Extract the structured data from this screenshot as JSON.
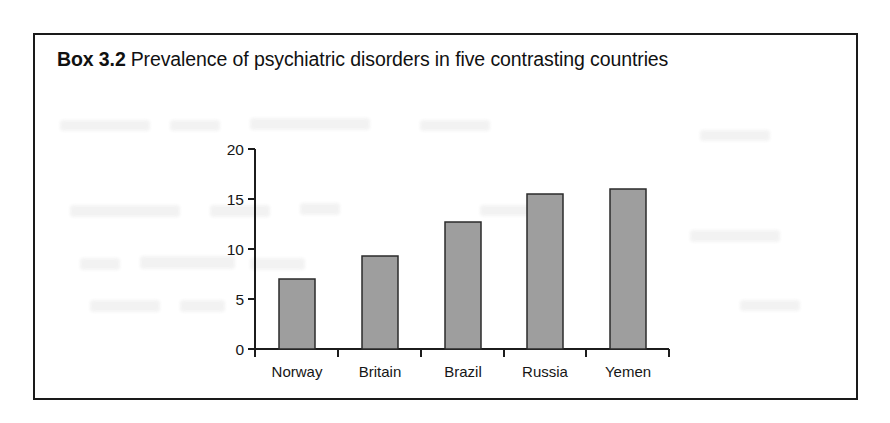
{
  "page": {
    "background_color": "#ffffff",
    "box_border_color": "#1a1a1a"
  },
  "box": {
    "number_label": "Box 3.2",
    "title_text": "Prevalence of psychiatric disorders in five contrasting countries"
  },
  "chart_data": {
    "type": "bar",
    "title": "Prevalence of psychiatric disorders in five contrasting countries",
    "xlabel": "",
    "ylabel": "",
    "categories": [
      "Norway",
      "Britain",
      "Brazil",
      "Russia",
      "Yemen"
    ],
    "values": [
      7.0,
      9.3,
      12.7,
      15.5,
      16.0
    ],
    "ylim": [
      0,
      20
    ],
    "ytick_labels": [
      "0",
      "5",
      "10",
      "15",
      "20"
    ],
    "ytick_values": [
      0,
      5,
      10,
      15,
      20
    ],
    "grid": false,
    "legend": false,
    "bar_fill_color": "#9e9e9e",
    "bar_edge_color": "#2b2b2b",
    "axis_color": "#1c1c1c"
  }
}
